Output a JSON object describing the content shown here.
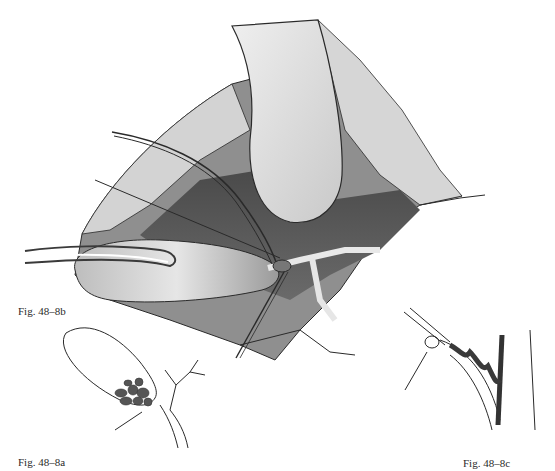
{
  "figures": {
    "main": {
      "label": "Fig. 48–8b"
    },
    "inset_left": {
      "label": "Fig. 48–8a"
    },
    "inset_right": {
      "label": "Fig. 48–8c"
    }
  },
  "colors": {
    "ink": "#2a2a2a",
    "dark_shade": "#3a3a3a",
    "mid_shade": "#8a8a8a",
    "light_shade": "#d8d8d8",
    "stone": "#555555",
    "paper": "#ffffff"
  }
}
